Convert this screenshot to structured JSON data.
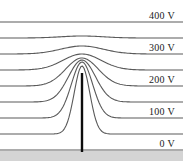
{
  "figure": {
    "name": "potential-contour-plot",
    "background_color": "#ffffff",
    "width": 183,
    "height": 164
  },
  "chart_data": {
    "type": "line",
    "title": "",
    "xlabel": "",
    "ylabel": "",
    "legend_position": "right-inline",
    "grid": false,
    "axis_ranges": {
      "x": [
        0,
        183
      ],
      "y": [
        0,
        164
      ]
    },
    "tick_labels": [
      "400 V",
      "300 V",
      "200 V",
      "100 V",
      "0 V"
    ],
    "labeled_levels": [
      400,
      300,
      200,
      100,
      0
    ],
    "level_unit": "V",
    "curve_color": "#5a5a5a",
    "curve_width": 1.1,
    "curves": [
      {
        "level_label": "400 V",
        "level_value": 400,
        "baseline_y": 22,
        "peak_height": 0,
        "peak_width": 26,
        "labeled": true
      },
      {
        "level_label": "",
        "level_value": 350,
        "baseline_y": 38,
        "peak_height": 2,
        "peak_width": 30,
        "labeled": false
      },
      {
        "level_label": "300 V",
        "level_value": 300,
        "baseline_y": 54,
        "peak_height": 8,
        "peak_width": 30,
        "labeled": true
      },
      {
        "level_label": "",
        "level_value": 250,
        "baseline_y": 70,
        "peak_height": 16,
        "peak_width": 27,
        "labeled": false
      },
      {
        "level_label": "200 V",
        "level_value": 200,
        "baseline_y": 86,
        "peak_height": 28,
        "peak_width": 23,
        "labeled": true
      },
      {
        "level_label": "",
        "level_value": 150,
        "baseline_y": 102,
        "peak_height": 42,
        "peak_width": 19,
        "labeled": false
      },
      {
        "level_label": "100 V",
        "level_value": 100,
        "baseline_y": 118,
        "peak_height": 56,
        "peak_width": 15,
        "labeled": true
      },
      {
        "level_label": "",
        "level_value": 50,
        "baseline_y": 134,
        "peak_height": 68,
        "peak_width": 11,
        "labeled": false
      },
      {
        "level_label": "0 V",
        "level_value": 0,
        "baseline_y": 150,
        "peak_height": 0,
        "peak_width": 10,
        "labeled": true
      }
    ],
    "emitter_bar": {
      "label": "emitter-tip",
      "center_x": 82,
      "top_y": 73,
      "bottom_y": 152,
      "width": 2.4,
      "color": "#0d0d0d"
    },
    "substrate_band": {
      "label": "substrate",
      "top_y": 151,
      "height": 10,
      "color": "#d4d4d4",
      "edge_color": "#9a9a9a"
    }
  },
  "labels": {
    "level_400": "400 V",
    "level_300": "300 V",
    "level_200": "200 V",
    "level_100": "100 V",
    "level_0": "0 V"
  }
}
